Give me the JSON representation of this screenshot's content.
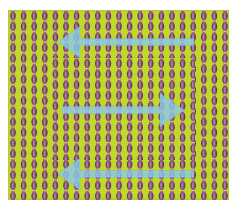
{
  "figure": {
    "name": "beaded-texture-illusion",
    "canvas": {
      "width": 241,
      "height": 216,
      "background": "#ffffff"
    },
    "panel": {
      "x": 8,
      "y": 10,
      "width": 221,
      "height": 190,
      "background_color": "#c2da2b"
    }
  },
  "colors": {
    "background_white": "#ffffff",
    "panel_green": "#c2da2b",
    "panel_green_light": "#cfe342",
    "bead_purple": "#9c5a8d",
    "bead_purple_dark": "#6d3c63",
    "bead_highlight": "#e8dcb4",
    "bead_edge_dark": "#4a3038",
    "arrow_blue": "#8ecbe8",
    "arrow_blue_edge": "#72b8dd"
  },
  "texture": {
    "type": "vertical-bead-chains",
    "column_count": 20,
    "column_spacing_px": 10.6,
    "column_start_x": 13,
    "bead_width_px": 7.4,
    "bead_height_px": 10.6,
    "bead_period_px": 10.6,
    "outer_phase_offset_px": 0,
    "inner_phase_offset_px": 5.3,
    "description": "Purple lens-shaped beads stacked vertically into continuous chains on a yellow-green field"
  },
  "inner_region": {
    "name": "phase-shifted-rectangle",
    "x": 48,
    "y": 58,
    "width": 147,
    "height": 102,
    "phase_shift": "half-period",
    "note": "Beads inside this rectangle are offset by half the vertical period relative to the surround"
  },
  "arrows": [
    {
      "id": "arrow-top",
      "label": "top-arrow",
      "direction": "left",
      "x": 58,
      "y": 26,
      "width": 136,
      "height": 32,
      "shaft_thickness": 7,
      "head_length": 22,
      "head_half_height": 16,
      "color": "#8ecbe8",
      "opacity": 0.82
    },
    {
      "id": "arrow-middle",
      "label": "middle-arrow",
      "direction": "right",
      "x": 62,
      "y": 93,
      "width": 122,
      "height": 34,
      "shaft_thickness": 7,
      "head_length": 24,
      "head_half_height": 17,
      "color": "#8ecbe8",
      "opacity": 0.82
    },
    {
      "id": "arrow-bottom",
      "label": "bottom-arrow",
      "direction": "left",
      "x": 58,
      "y": 158,
      "width": 136,
      "height": 32,
      "shaft_thickness": 7,
      "head_length": 22,
      "head_half_height": 16,
      "color": "#8ecbe8",
      "opacity": 0.82
    }
  ],
  "accessibility": {
    "caption": "A yellow-green square filled with twenty vertical chains of purple lens-shaped beads. A central rectangular region has its beads shifted by half a period. Three translucent light-blue arrows overlay the pattern: the top arrow points left, the middle arrow points right, and the bottom arrow points left."
  }
}
